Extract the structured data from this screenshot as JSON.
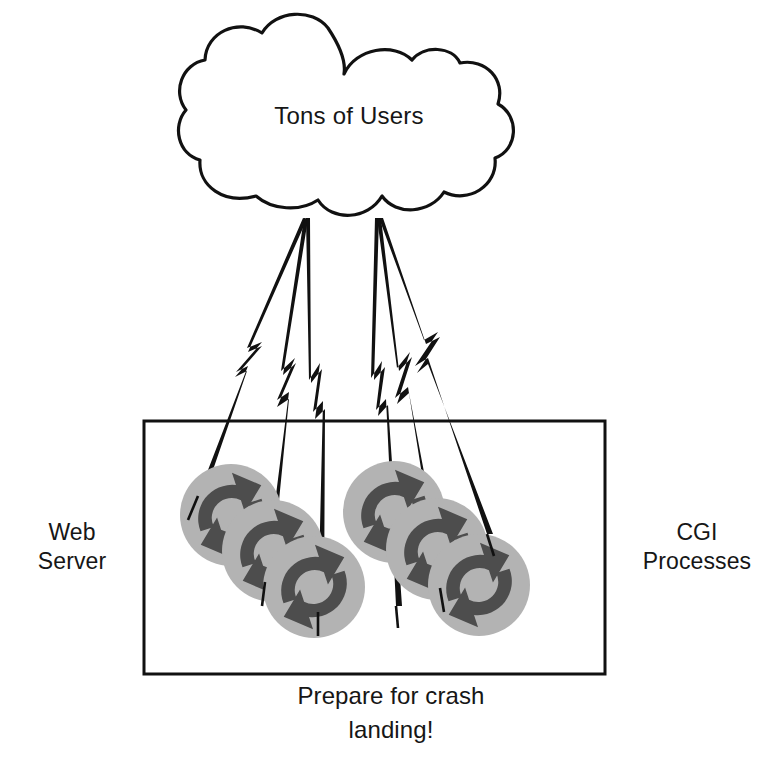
{
  "diagram": {
    "cloud": {
      "label": "Tons of Users",
      "name": "users-cloud"
    },
    "box": {
      "name": "web-server-boundary"
    },
    "labels": {
      "left": "Web\nServer",
      "right": "CGI\nProcesses",
      "caption": "Prepare for crash\nlanding!"
    },
    "processes": {
      "count": 6,
      "icon": "recycle-arrows-icon",
      "groups": [
        {
          "name": "cgi-process-group-left",
          "items": [
            {
              "cx": 231,
              "cy": 515,
              "r": 51
            },
            {
              "cx": 273,
              "cy": 551,
              "r": 51
            },
            {
              "cx": 314,
              "cy": 587,
              "r": 51
            }
          ]
        },
        {
          "name": "cgi-process-group-right",
          "items": [
            {
              "cx": 394,
              "cy": 512,
              "r": 51
            },
            {
              "cx": 437,
              "cy": 549,
              "r": 51
            },
            {
              "cx": 479,
              "cy": 585,
              "r": 51
            }
          ]
        }
      ]
    },
    "bolts": {
      "name": "lightning-bolt-connector",
      "left_origin": {
        "x": 303,
        "y": 218
      },
      "right_origin": {
        "x": 375,
        "y": 218
      },
      "count": 6
    },
    "colors": {
      "stroke": "#111111",
      "circle_light": "#b3b3b3",
      "arrow_dark": "#4d4d4d",
      "background": "#ffffff"
    }
  }
}
